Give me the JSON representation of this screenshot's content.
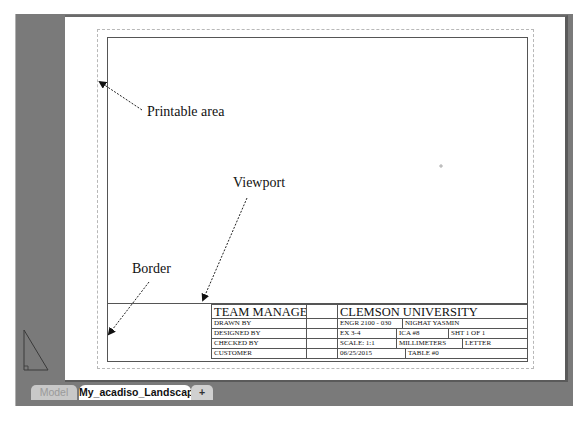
{
  "layout_tabs": [
    {
      "label": "Model",
      "active": false
    },
    {
      "label": "My_acadiso_Landscape",
      "active": true
    },
    {
      "label": "+",
      "active": false
    }
  ],
  "annotations": {
    "printable_area": "Printable area",
    "viewport": "Viewport",
    "border": "Border"
  },
  "title_block": {
    "left": {
      "header": "TEAM MANAGER",
      "rows": [
        "DRAWN BY",
        "DESIGNED BY",
        "CHECKED BY",
        "CUSTOMER"
      ]
    },
    "right": {
      "header": "CLEMSON UNIVERSITY",
      "course": "ENGR 2100 - 030",
      "name": "NIGHAT YASMIN",
      "exercise": "EX 3-4",
      "ica": "ICA #8",
      "sheet": "SHT 1 OF 1",
      "scale": "SCALE: 1:1",
      "units": "MILLIMETERS",
      "paper": "LETTER",
      "date": "06/25/2015",
      "table": "TABLE #0"
    }
  },
  "colors": {
    "workspace_bg": "#7a7a7a",
    "paper": "#ffffff",
    "border_line": "#555555"
  }
}
